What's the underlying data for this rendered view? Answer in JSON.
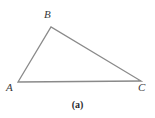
{
  "figure": {
    "caption": "(a)",
    "background_color": "#ffffff",
    "width": 155,
    "height": 118,
    "stroke_color": "#8a8a8a",
    "stroke_width": 1.3,
    "label_color": "#38383a",
    "caption_color": "#2b2b2d"
  },
  "chart_data": {
    "type": "diagram",
    "shape": "triangle",
    "title": "(a)",
    "xlabel": "",
    "ylabel": "",
    "vertices": [
      {
        "label": "A",
        "x": 18,
        "y": 82,
        "label_x": 11,
        "label_y": 88
      },
      {
        "label": "B",
        "x": 51,
        "y": 27,
        "label_x": 49,
        "label_y": 15
      },
      {
        "label": "C",
        "x": 141,
        "y": 81,
        "label_x": 143,
        "label_y": 88
      }
    ],
    "edges": [
      {
        "name": "AB",
        "from": "A",
        "to": "B"
      },
      {
        "name": "BC",
        "from": "B",
        "to": "C"
      },
      {
        "name": "AC",
        "from": "A",
        "to": "C"
      }
    ],
    "polygon_points": "18,82 51,27 141,81",
    "fill": "none",
    "grid": false,
    "legend": false
  },
  "labels": {
    "a": "A",
    "b": "B",
    "c": "C"
  }
}
